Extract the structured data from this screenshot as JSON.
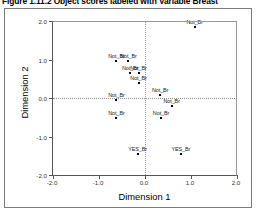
{
  "figure": {
    "caption": "Figure 1.11.2 Object scores labeled with Variable Breast"
  },
  "chart_data": {
    "type": "scatter",
    "title": "Figure 1.11.2 Object scores labeled with Variable Breast",
    "xlabel": "Dimension 1",
    "ylabel": "Dimension 2",
    "xlim": [
      -2.0,
      2.0
    ],
    "ylim": [
      -2.0,
      2.0
    ],
    "xticks": [
      "-2.0",
      "-1.0",
      "0.0",
      "1.0",
      "2.0"
    ],
    "xtick_values": [
      -2.0,
      -1.0,
      0.0,
      1.0,
      2.0
    ],
    "yticks": [
      "-2.0",
      "-1.0",
      "0.0",
      "1.0",
      "2.0"
    ],
    "ytick_values": [
      -2.0,
      -1.0,
      0.0,
      1.0,
      2.0
    ],
    "grid": false,
    "reference_lines": {
      "x": 0.0,
      "y": 0.0,
      "style": "dotted"
    },
    "legend": null,
    "point_label_field": "Breast",
    "points": [
      {
        "label": "Not_Br",
        "x": 1.08,
        "y": 1.85
      },
      {
        "label": "Not_Br",
        "x": -0.62,
        "y": 0.97
      },
      {
        "label": "Not_Br",
        "x": -0.36,
        "y": 0.97
      },
      {
        "label": "Not_Br",
        "x": -0.32,
        "y": 0.66
      },
      {
        "label": "Not_Br",
        "x": -0.14,
        "y": 0.66
      },
      {
        "label": "Not_Br",
        "x": -0.14,
        "y": 0.38
      },
      {
        "label": "Not_Br",
        "x": 0.33,
        "y": 0.07
      },
      {
        "label": "Not_Br",
        "x": -0.62,
        "y": -0.05
      },
      {
        "label": "Not_Br",
        "x": 0.58,
        "y": -0.22
      },
      {
        "label": "Not_Br",
        "x": -0.62,
        "y": -0.53
      },
      {
        "label": "Not_Br",
        "x": 0.35,
        "y": -0.53
      },
      {
        "label": "YES_Br",
        "x": -0.16,
        "y": -1.45
      },
      {
        "label": "YES_Br",
        "x": 0.78,
        "y": -1.45
      }
    ]
  }
}
